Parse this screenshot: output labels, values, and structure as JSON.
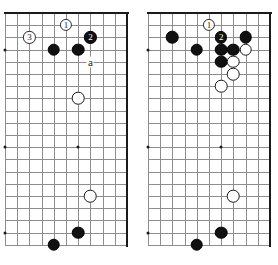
{
  "figure": {
    "kind": "go-board-diagram-pair",
    "background_color": "#ffffff",
    "grid_color": "#8d8d8d",
    "edge_color": "#1a1a1a",
    "black_stone_color": "#111111",
    "white_stone_color": "#ffffff"
  },
  "diagrams": [
    {
      "id": "left",
      "name": "diagram-left",
      "caption": "",
      "frame": {
        "x": 2,
        "y": 10,
        "w": 129,
        "h": 243
      },
      "grid": {
        "cols": 11,
        "rows": 20,
        "cell": 12.2,
        "origin_x": 3.0,
        "origin_y": 3.0
      },
      "star_points": [
        {
          "col": 0,
          "row": 3
        },
        {
          "col": 0,
          "row": 11
        },
        {
          "col": 0,
          "row": 18
        },
        {
          "col": 6,
          "row": 11
        }
      ],
      "edges": {
        "top": true,
        "right": true,
        "bottom": false,
        "left": false
      },
      "stones": [
        {
          "col": 4,
          "row": 3,
          "color": "black",
          "label": ""
        },
        {
          "col": 6,
          "row": 3,
          "color": "black",
          "label": ""
        },
        {
          "col": 7,
          "row": 2,
          "color": "black",
          "label": "2"
        },
        {
          "col": 5,
          "row": 1,
          "color": "white",
          "label": "1"
        },
        {
          "col": 2,
          "row": 2,
          "color": "white",
          "label": "3"
        },
        {
          "col": 6,
          "row": 7,
          "color": "white",
          "label": ""
        },
        {
          "col": 7,
          "row": 15,
          "color": "white",
          "label": ""
        },
        {
          "col": 6,
          "row": 18,
          "color": "black",
          "label": ""
        },
        {
          "col": 4,
          "row": 19,
          "color": "black",
          "label": ""
        }
      ],
      "letter_marks": [
        {
          "col": 7,
          "row": 4,
          "text": "a"
        }
      ]
    },
    {
      "id": "right",
      "name": "diagram-right",
      "caption": "",
      "frame": {
        "x": 145,
        "y": 10,
        "w": 129,
        "h": 243
      },
      "grid": {
        "cols": 11,
        "rows": 20,
        "cell": 12.2,
        "origin_x": 3.0,
        "origin_y": 3.0
      },
      "star_points": [
        {
          "col": 0,
          "row": 3
        },
        {
          "col": 0,
          "row": 11
        },
        {
          "col": 0,
          "row": 18
        },
        {
          "col": 6,
          "row": 11
        }
      ],
      "edges": {
        "top": true,
        "right": true,
        "bottom": false,
        "left": false
      },
      "stones": [
        {
          "col": 2,
          "row": 2,
          "color": "black",
          "label": ""
        },
        {
          "col": 4,
          "row": 3,
          "color": "black",
          "label": ""
        },
        {
          "col": 6,
          "row": 3,
          "color": "black",
          "label": ""
        },
        {
          "col": 7,
          "row": 3,
          "color": "black",
          "label": ""
        },
        {
          "col": 6,
          "row": 4,
          "color": "black",
          "label": ""
        },
        {
          "col": 8,
          "row": 2,
          "color": "black",
          "label": ""
        },
        {
          "col": 6,
          "row": 2,
          "color": "black",
          "label": "2"
        },
        {
          "col": 5,
          "row": 1,
          "color": "white",
          "label": "1"
        },
        {
          "col": 8,
          "row": 3,
          "color": "white",
          "label": ""
        },
        {
          "col": 7,
          "row": 4,
          "color": "white",
          "label": ""
        },
        {
          "col": 7,
          "row": 5,
          "color": "white",
          "label": ""
        },
        {
          "col": 6,
          "row": 6,
          "color": "white",
          "label": ""
        },
        {
          "col": 7,
          "row": 15,
          "color": "white",
          "label": ""
        },
        {
          "col": 6,
          "row": 18,
          "color": "black",
          "label": ""
        },
        {
          "col": 4,
          "row": 19,
          "color": "black",
          "label": ""
        }
      ],
      "letter_marks": []
    }
  ]
}
